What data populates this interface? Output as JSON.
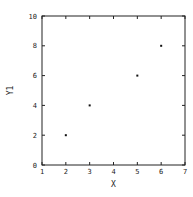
{
  "chart_data": {
    "type": "scatter",
    "title": "",
    "xlabel": "X",
    "ylabel": "Y1",
    "xlim": [
      1,
      7
    ],
    "ylim": [
      0,
      10
    ],
    "xticks": [
      1,
      2,
      3,
      4,
      5,
      6,
      7
    ],
    "yticks": [
      0,
      2,
      4,
      6,
      8,
      10
    ],
    "grid": false,
    "legend": null,
    "series": [
      {
        "name": "Y1",
        "x": [
          2,
          3,
          5,
          6
        ],
        "y": [
          2,
          4,
          6,
          8
        ],
        "marker": "dot",
        "color": "#111111"
      }
    ]
  },
  "layout": {
    "plot_left": 42,
    "plot_right": 185,
    "plot_top": 16,
    "plot_bottom": 165
  }
}
